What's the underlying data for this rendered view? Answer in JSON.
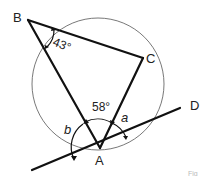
{
  "figure": {
    "type": "circle-geometry",
    "points": {
      "B": {
        "label": "B",
        "x": 28,
        "y": 20
      },
      "C": {
        "label": "C",
        "x": 143,
        "y": 58
      },
      "A": {
        "label": "A",
        "x": 100,
        "y": 148
      },
      "D": {
        "label": "D",
        "x": 190,
        "y": 108
      }
    },
    "circle": {
      "cx": 98,
      "cy": 84,
      "r": 66
    },
    "tangent": {
      "x1": 32,
      "y1": 170,
      "x2": 180,
      "y2": 108
    },
    "angles": {
      "at_B": {
        "label": "43°",
        "value_deg": 43
      },
      "at_A_BAC": {
        "label": "58°",
        "value_deg": 58
      },
      "a": {
        "label": "a"
      },
      "b": {
        "label": "b"
      }
    },
    "labels": {
      "B": "B",
      "C": "C",
      "A": "A",
      "D": "D",
      "angle_B": "43°",
      "angle_A": "58°",
      "angle_a": "a",
      "angle_b": "b",
      "fig_mark": "Fig"
    },
    "colors": {
      "line": "#111111",
      "circle": "#555555",
      "text": "#222222",
      "background": "#ffffff"
    }
  }
}
